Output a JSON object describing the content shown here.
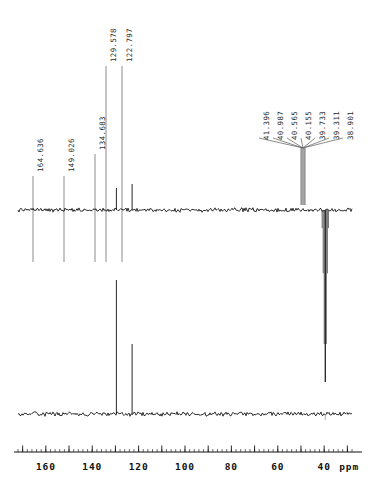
{
  "figure": {
    "kind": "nmr-spectrum",
    "nucleus": "13C",
    "experiment": "DEPT-135 and broadband-decoupled 13C",
    "background_color": "#ffffff",
    "trace_color": "#000000",
    "label_color": "#2a2a2a",
    "leader_color": "#5a5a5a"
  },
  "axis": {
    "unit_label": "ppm",
    "tick_labels": [
      "160",
      "140",
      "120",
      "100",
      "80",
      "60",
      "40"
    ],
    "tick_values": [
      160,
      140,
      120,
      100,
      80,
      60,
      40
    ],
    "major_tick_values": [
      170,
      160,
      150,
      140,
      130,
      120,
      110,
      100,
      90,
      80,
      70,
      60,
      50,
      40,
      30
    ],
    "minor_tick_step": 2,
    "ppm_min": 28,
    "ppm_max": 172,
    "direction": "decreasing-left-to-right"
  },
  "traces": [
    {
      "name": "dept-135",
      "baseline_y": 210,
      "peaks": [
        {
          "ppm": 129.578,
          "direction": "up",
          "height": 22
        },
        {
          "ppm": 122.797,
          "direction": "up",
          "height": 26
        },
        {
          "ppm": 39.52,
          "direction": "down",
          "height": 172
        }
      ]
    },
    {
      "name": "carbon-13",
      "baseline_y": 414,
      "peaks": [
        {
          "ppm": 129.578,
          "direction": "up",
          "height": 134
        },
        {
          "ppm": 122.797,
          "direction": "up",
          "height": 70
        }
      ]
    }
  ],
  "peak_labels": [
    {
      "id": "p1",
      "text": "164.636",
      "ppm": 164.636,
      "x": 33,
      "label_bottom_y": 172,
      "leader_top_y": 176,
      "leader_bottom_y": 262
    },
    {
      "id": "p2",
      "text": "149.026",
      "ppm": 149.026,
      "x": 64,
      "label_bottom_y": 172,
      "leader_top_y": 176,
      "leader_bottom_y": 262
    },
    {
      "id": "p3",
      "text": "134.683",
      "ppm": 134.683,
      "x": 95,
      "label_bottom_y": 150,
      "leader_top_y": 154,
      "leader_bottom_y": 262
    },
    {
      "id": "p4",
      "text": "129.578",
      "ppm": 129.578,
      "x": 106,
      "label_bottom_y": 62,
      "leader_top_y": 66,
      "leader_bottom_y": 262
    },
    {
      "id": "p5",
      "text": "122.797",
      "ppm": 122.797,
      "x": 122,
      "label_bottom_y": 62,
      "leader_top_y": 66,
      "leader_bottom_y": 262
    }
  ],
  "cluster": {
    "name": "dmso-d6-septet",
    "converge_x": 303,
    "converge_y": 148,
    "stem_bottom_y": 205,
    "labels": [
      {
        "id": "c1",
        "text": "41.396",
        "ppm": 41.396,
        "x": 259,
        "label_bottom_y": 140,
        "fan_y": 138
      },
      {
        "id": "c2",
        "text": "40.987",
        "ppm": 40.987,
        "x": 273,
        "label_bottom_y": 140,
        "fan_y": 138
      },
      {
        "id": "c3",
        "text": "40.565",
        "ppm": 40.565,
        "x": 287,
        "label_bottom_y": 140,
        "fan_y": 138
      },
      {
        "id": "c4",
        "text": "40.155",
        "ppm": 40.155,
        "x": 301,
        "label_bottom_y": 140,
        "fan_y": 138
      },
      {
        "id": "c5",
        "text": "39.733",
        "ppm": 39.733,
        "x": 315,
        "label_bottom_y": 140,
        "fan_y": 138
      },
      {
        "id": "c6",
        "text": "39.311",
        "ppm": 39.311,
        "x": 329,
        "label_bottom_y": 140,
        "fan_y": 138
      },
      {
        "id": "c7",
        "text": "38.901",
        "ppm": 38.901,
        "x": 343,
        "label_bottom_y": 140,
        "fan_y": 138
      }
    ]
  },
  "chart_data": {
    "type": "line",
    "title": "",
    "xlabel": "ppm",
    "ylabel": "",
    "xlim": [
      172,
      28
    ],
    "grid": false,
    "legend": "none",
    "series": [
      {
        "name": "DEPT-135",
        "x": [
          164.636,
          149.026,
          134.683,
          129.578,
          122.797,
          41.396,
          40.987,
          40.565,
          40.155,
          39.733,
          39.311,
          38.901
        ],
        "values": [
          0,
          0,
          0,
          22,
          26,
          -30,
          -70,
          -130,
          -172,
          -130,
          -70,
          -30
        ]
      },
      {
        "name": "13C broadband-decoupled",
        "x": [
          164.636,
          149.026,
          134.683,
          129.578,
          122.797,
          41.396,
          40.987,
          40.565,
          40.155,
          39.733,
          39.311,
          38.901
        ],
        "values": [
          0,
          0,
          0,
          134,
          70,
          0,
          0,
          0,
          0,
          0,
          0,
          0
        ]
      }
    ],
    "annotations": [
      "164.636",
      "149.026",
      "134.683",
      "129.578",
      "122.797",
      "41.396",
      "40.987",
      "40.565",
      "40.155",
      "39.733",
      "39.311",
      "38.901"
    ],
    "tick_labels": [
      "160",
      "140",
      "120",
      "100",
      "80",
      "60",
      "40"
    ]
  }
}
